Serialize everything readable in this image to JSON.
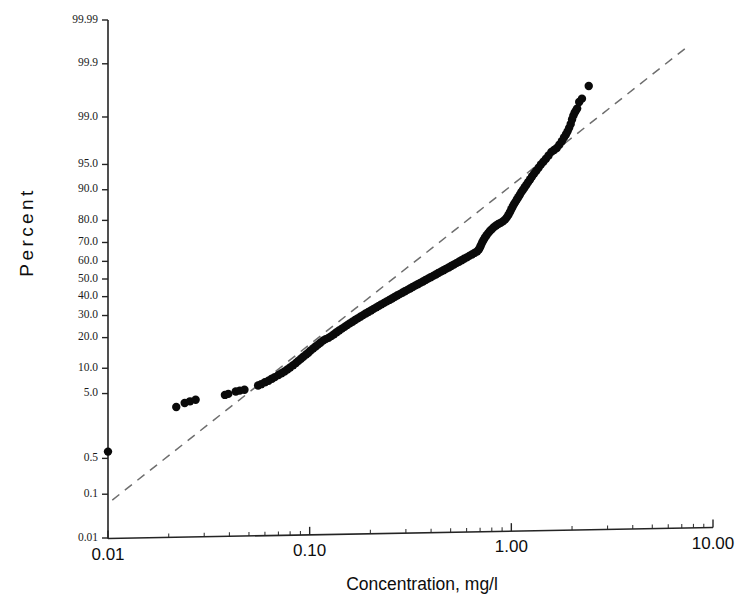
{
  "chart_data": {
    "type": "scatter",
    "title": "",
    "subtitle": "",
    "plot_kind": "lognormal-probability-plot",
    "xlabel": "Concentration, mg/l",
    "ylabel": "Percent",
    "xscale": "log",
    "yscale": "probability",
    "xlim": [
      0.01,
      10.0
    ],
    "ylim": [
      0.01,
      99.99
    ],
    "grid": false,
    "legend": null,
    "xticks": [
      {
        "value": 0.01,
        "label": "0.01"
      },
      {
        "value": 0.1,
        "label": "0.10"
      },
      {
        "value": 1.0,
        "label": "1.00"
      },
      {
        "value": 10.0,
        "label": "10.00"
      }
    ],
    "yticks": [
      {
        "value": 99.99,
        "label": "99.99"
      },
      {
        "value": 99.9,
        "label": "99.9"
      },
      {
        "value": 99.0,
        "label": "99.0"
      },
      {
        "value": 95.0,
        "label": "95.0"
      },
      {
        "value": 90.0,
        "label": "90.0"
      },
      {
        "value": 80.0,
        "label": "80.0"
      },
      {
        "value": 70.0,
        "label": "70.0"
      },
      {
        "value": 60.0,
        "label": "60.0"
      },
      {
        "value": 50.0,
        "label": "50.0"
      },
      {
        "value": 40.0,
        "label": "40.0"
      },
      {
        "value": 30.0,
        "label": "30.0"
      },
      {
        "value": 20.0,
        "label": "20.0"
      },
      {
        "value": 10.0,
        "label": "10.0"
      },
      {
        "value": 5.0,
        "label": "5.0"
      },
      {
        "value": 0.5,
        "label": "0.5"
      },
      {
        "value": 0.1,
        "label": "0.1"
      },
      {
        "value": 0.01,
        "label": "0.01"
      }
    ],
    "reference_line": {
      "style": "dashed",
      "color": "#6e6e6e",
      "x_start": 0.0105,
      "y_start": 0.075,
      "x_end": 7.6,
      "y_end": 99.96
    },
    "series": [
      {
        "name": "Concentration sample",
        "marker": "filled-circle",
        "color": "#0a0a0a",
        "n_points": 152,
        "points": [
          [
            0.01,
            0.66
          ],
          [
            0.0218,
            3.3
          ],
          [
            0.024,
            3.75
          ],
          [
            0.0255,
            3.95
          ],
          [
            0.0272,
            4.15
          ],
          [
            0.038,
            4.8
          ],
          [
            0.0395,
            4.95
          ],
          [
            0.043,
            5.3
          ],
          [
            0.045,
            5.45
          ],
          [
            0.0475,
            5.6
          ],
          [
            0.0555,
            6.3
          ],
          [
            0.0575,
            6.55
          ],
          [
            0.06,
            6.9
          ],
          [
            0.0625,
            7.2
          ],
          [
            0.065,
            7.6
          ],
          [
            0.0672,
            7.95
          ],
          [
            0.07,
            8.4
          ],
          [
            0.0725,
            8.8
          ],
          [
            0.075,
            9.2
          ],
          [
            0.0775,
            9.7
          ],
          [
            0.08,
            10.2
          ],
          [
            0.0828,
            10.8
          ],
          [
            0.0855,
            11.4
          ],
          [
            0.088,
            12.0
          ],
          [
            0.0905,
            12.6
          ],
          [
            0.093,
            13.2
          ],
          [
            0.096,
            13.9
          ],
          [
            0.0985,
            14.5
          ],
          [
            0.101,
            15.2
          ],
          [
            0.104,
            15.9
          ],
          [
            0.107,
            16.6
          ],
          [
            0.11,
            17.3
          ],
          [
            0.113,
            18.0
          ],
          [
            0.1165,
            18.8
          ],
          [
            0.12,
            19.4
          ],
          [
            0.124,
            19.9
          ],
          [
            0.128,
            20.6
          ],
          [
            0.132,
            21.4
          ],
          [
            0.136,
            22.2
          ],
          [
            0.14,
            23.0
          ],
          [
            0.1445,
            23.8
          ],
          [
            0.149,
            24.6
          ],
          [
            0.1535,
            25.4
          ],
          [
            0.158,
            26.2
          ],
          [
            0.163,
            27.0
          ],
          [
            0.168,
            27.8
          ],
          [
            0.173,
            28.6
          ],
          [
            0.1785,
            29.4
          ],
          [
            0.184,
            30.2
          ],
          [
            0.1895,
            31.0
          ],
          [
            0.1955,
            31.8
          ],
          [
            0.2015,
            32.6
          ],
          [
            0.2075,
            33.4
          ],
          [
            0.214,
            34.2
          ],
          [
            0.2205,
            35.0
          ],
          [
            0.227,
            35.8
          ],
          [
            0.234,
            36.6
          ],
          [
            0.241,
            37.4
          ],
          [
            0.2485,
            38.2
          ],
          [
            0.256,
            39.0
          ],
          [
            0.2635,
            39.8
          ],
          [
            0.2715,
            40.6
          ],
          [
            0.2795,
            41.4
          ],
          [
            0.288,
            42.2
          ],
          [
            0.2965,
            43.0
          ],
          [
            0.3055,
            43.8
          ],
          [
            0.3145,
            44.6
          ],
          [
            0.324,
            45.4
          ],
          [
            0.3335,
            46.2
          ],
          [
            0.3435,
            47.0
          ],
          [
            0.354,
            47.8
          ],
          [
            0.3645,
            48.6
          ],
          [
            0.3755,
            49.4
          ],
          [
            0.3865,
            50.2
          ],
          [
            0.398,
            51.0
          ],
          [
            0.41,
            51.8
          ],
          [
            0.422,
            52.6
          ],
          [
            0.4345,
            53.4
          ],
          [
            0.4475,
            54.2
          ],
          [
            0.461,
            55.0
          ],
          [
            0.4745,
            55.8
          ],
          [
            0.489,
            56.6
          ],
          [
            0.5035,
            57.4
          ],
          [
            0.5185,
            58.2
          ],
          [
            0.534,
            59.0
          ],
          [
            0.55,
            59.8
          ],
          [
            0.5665,
            60.6
          ],
          [
            0.5835,
            61.4
          ],
          [
            0.601,
            62.2
          ],
          [
            0.619,
            63.0
          ],
          [
            0.6375,
            63.8
          ],
          [
            0.6565,
            64.6
          ],
          [
            0.676,
            65.4
          ],
          [
            0.69,
            66.4
          ],
          [
            0.7,
            67.6
          ],
          [
            0.708,
            68.8
          ],
          [
            0.717,
            70.0
          ],
          [
            0.728,
            71.2
          ],
          [
            0.74,
            72.4
          ],
          [
            0.754,
            73.5
          ],
          [
            0.769,
            74.6
          ],
          [
            0.785,
            75.6
          ],
          [
            0.802,
            76.4
          ],
          [
            0.82,
            77.2
          ],
          [
            0.84,
            77.9
          ],
          [
            0.862,
            78.5
          ],
          [
            0.885,
            79.0
          ],
          [
            0.908,
            79.6
          ],
          [
            0.93,
            80.3
          ],
          [
            0.95,
            81.2
          ],
          [
            0.968,
            82.2
          ],
          [
            0.985,
            83.2
          ],
          [
            1.0,
            84.2
          ],
          [
            1.016,
            85.1
          ],
          [
            1.032,
            85.9
          ],
          [
            1.048,
            86.6
          ],
          [
            1.065,
            87.3
          ],
          [
            1.083,
            88.0
          ],
          [
            1.102,
            88.7
          ],
          [
            1.122,
            89.4
          ],
          [
            1.143,
            90.0
          ],
          [
            1.165,
            90.6
          ],
          [
            1.188,
            91.2
          ],
          [
            1.213,
            91.8
          ],
          [
            1.24,
            92.4
          ],
          [
            1.268,
            93.0
          ],
          [
            1.298,
            93.5
          ],
          [
            1.33,
            94.0
          ],
          [
            1.365,
            94.5
          ],
          [
            1.402,
            95.0
          ],
          [
            1.442,
            95.4
          ],
          [
            1.485,
            95.8
          ],
          [
            1.53,
            96.2
          ],
          [
            1.58,
            96.6
          ],
          [
            1.63,
            96.8
          ],
          [
            1.68,
            97.0
          ],
          [
            1.73,
            97.3
          ],
          [
            1.78,
            97.6
          ],
          [
            1.825,
            97.9
          ],
          [
            1.865,
            98.1
          ],
          [
            1.9,
            98.3
          ],
          [
            1.935,
            98.5
          ],
          [
            1.97,
            98.7
          ],
          [
            2.0,
            98.9
          ],
          [
            2.03,
            99.05
          ],
          [
            2.06,
            99.15
          ],
          [
            2.09,
            99.22
          ],
          [
            2.12,
            99.28
          ],
          [
            2.17,
            99.45
          ],
          [
            2.24,
            99.52
          ],
          [
            2.42,
            99.72
          ]
        ]
      }
    ]
  },
  "axes": {
    "x_title": "Concentration, mg/l",
    "y_title": "Percent"
  }
}
